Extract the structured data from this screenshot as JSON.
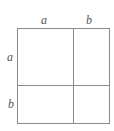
{
  "diagram": {
    "top_labels": [
      "a",
      "b"
    ],
    "left_labels": [
      "a",
      "b"
    ],
    "line_color": "#8a8a8a",
    "label_color": "#555555"
  }
}
